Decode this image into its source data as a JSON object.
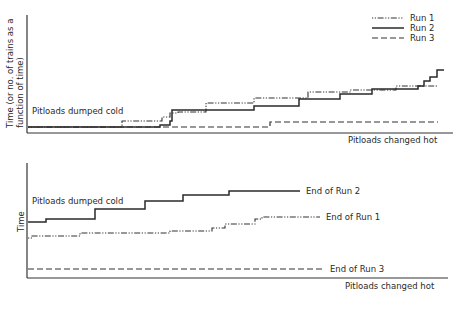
{
  "legend": {
    "items": [
      {
        "name": "Run 1",
        "style": "dash-dot-dot"
      },
      {
        "name": "Run 2",
        "style": "solid"
      },
      {
        "name": "Run 3",
        "style": "dashed"
      }
    ]
  },
  "top_panel": {
    "ylabel_line1": "Time (or no. of trains as a",
    "ylabel_line2": "function of time)",
    "inline_label": "Pitloads dumped cold",
    "xlabel": "Pitloads changed hot"
  },
  "bottom_panel": {
    "ylabel": "Time",
    "inline_label": "Pitloads dumped cold",
    "xlabel": "Pitloads changed hot",
    "end_labels": {
      "run1": "End of Run 1",
      "run2": "End of Run 2",
      "run3": "End of Run 3"
    }
  },
  "chart_data": [
    {
      "type": "line",
      "subtype": "step",
      "title": "",
      "xlabel": "Pitloads changed hot",
      "ylabel": "Time (or no. of trains as a function of time)",
      "annotations": [
        "Pitloads dumped cold"
      ],
      "legend_position": "top-right",
      "grid": false,
      "note": "No numeric ticks; coordinates are approximate pixel positions in the image (y increases downward)",
      "series": [
        {
          "name": "Run 1",
          "style": "dash-dot-dot",
          "points": [
            [
              28,
              127
            ],
            [
              122,
              127
            ],
            [
              122,
              121
            ],
            [
              162,
              121
            ],
            [
              162,
              117
            ],
            [
              170,
              117
            ],
            [
              170,
              113
            ],
            [
              178,
              113
            ],
            [
              178,
              112
            ],
            [
              206,
              112
            ],
            [
              206,
              103
            ],
            [
              254,
              103
            ],
            [
              254,
              98
            ],
            [
              308,
              98
            ],
            [
              308,
              92
            ],
            [
              350,
              92
            ],
            [
              350,
              90
            ],
            [
              396,
              90
            ],
            [
              396,
              86
            ],
            [
              438,
              86
            ]
          ]
        },
        {
          "name": "Run 2",
          "style": "solid",
          "points": [
            [
              28,
              127
            ],
            [
              160,
              127
            ],
            [
              160,
              125
            ],
            [
              170,
              125
            ],
            [
              170,
              121
            ],
            [
              172,
              121
            ],
            [
              172,
              110
            ],
            [
              254,
              110
            ],
            [
              254,
              106
            ],
            [
              299,
              106
            ],
            [
              299,
              99
            ],
            [
              340,
              99
            ],
            [
              340,
              94
            ],
            [
              372,
              94
            ],
            [
              372,
              89
            ],
            [
              418,
              89
            ],
            [
              418,
              86
            ],
            [
              424,
              86
            ],
            [
              424,
              81
            ],
            [
              430,
              81
            ],
            [
              430,
              77
            ],
            [
              437,
              77
            ],
            [
              437,
              70
            ],
            [
              444,
              70
            ]
          ]
        },
        {
          "name": "Run 3",
          "style": "dashed",
          "points": [
            [
              28,
              127
            ],
            [
              270,
              127
            ],
            [
              270,
              122
            ],
            [
              438,
              122
            ]
          ]
        }
      ]
    },
    {
      "type": "line",
      "subtype": "step",
      "title": "",
      "xlabel": "Pitloads changed hot",
      "ylabel": "Time",
      "annotations": [
        "Pitloads dumped cold",
        "End of Run 1",
        "End of Run 2",
        "End of Run 3"
      ],
      "grid": false,
      "note": "No numeric ticks; coordinates are approximate pixel positions in the image (y increases downward)",
      "series": [
        {
          "name": "Run 1",
          "style": "dash-dot-dot",
          "end_label": "End of Run 1",
          "points": [
            [
              28,
              238
            ],
            [
              32,
              238
            ],
            [
              32,
              236
            ],
            [
              80,
              236
            ],
            [
              80,
              233
            ],
            [
              170,
              233
            ],
            [
              170,
              231
            ],
            [
              212,
              231
            ],
            [
              212,
              228
            ],
            [
              225,
              228
            ],
            [
              225,
              224
            ],
            [
              255,
              224
            ],
            [
              255,
              219
            ],
            [
              262,
              219
            ],
            [
              262,
              217
            ],
            [
              320,
              217
            ]
          ]
        },
        {
          "name": "Run 2",
          "style": "solid",
          "end_label": "End of Run 2",
          "points": [
            [
              28,
              222
            ],
            [
              46,
              222
            ],
            [
              46,
              219
            ],
            [
              95,
              219
            ],
            [
              95,
              209
            ],
            [
              145,
              209
            ],
            [
              145,
              201
            ],
            [
              183,
              201
            ],
            [
              183,
              195
            ],
            [
              229,
              195
            ],
            [
              229,
              191
            ],
            [
              300,
              191
            ]
          ]
        },
        {
          "name": "Run 3",
          "style": "dashed",
          "end_label": "End of Run 3",
          "points": [
            [
              28,
              269
            ],
            [
              325,
              269
            ]
          ]
        }
      ]
    }
  ]
}
